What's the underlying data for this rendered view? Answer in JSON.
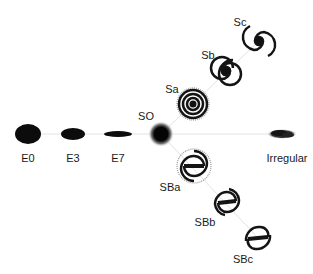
{
  "diagram": {
    "colors": {
      "ink": "#111111",
      "line": "#dcdcdc",
      "background": "#ffffff"
    },
    "nodes": [
      {
        "id": "E0",
        "label": "E0",
        "kind": "elliptical",
        "cx": 28,
        "cy": 134,
        "rx": 13,
        "ry": 10,
        "lx": 28,
        "ly": 158
      },
      {
        "id": "E3",
        "label": "E3",
        "kind": "elliptical",
        "cx": 73,
        "cy": 134,
        "rx": 12,
        "ry": 6,
        "lx": 73,
        "ly": 158
      },
      {
        "id": "E7",
        "label": "E7",
        "kind": "elliptical",
        "cx": 118,
        "cy": 134,
        "rx": 14,
        "ry": 3,
        "lx": 118,
        "ly": 158
      },
      {
        "id": "SO",
        "label": "SO",
        "kind": "lenticular",
        "cx": 161,
        "cy": 134,
        "r": 9,
        "lx": 146,
        "ly": 116
      },
      {
        "id": "Sa",
        "label": "Sa",
        "kind": "spiral",
        "cx": 193,
        "cy": 104,
        "r": 16,
        "lx": 172,
        "ly": 89
      },
      {
        "id": "Sb",
        "label": "Sb",
        "kind": "spiral",
        "cx": 226,
        "cy": 71,
        "r": 15,
        "lx": 208,
        "ly": 55
      },
      {
        "id": "Sc",
        "label": "Sc",
        "kind": "spiral",
        "cx": 259,
        "cy": 41,
        "r": 15,
        "lx": 240,
        "ly": 22
      },
      {
        "id": "SBa",
        "label": "SBa",
        "kind": "barred-spiral",
        "cx": 194,
        "cy": 166,
        "r": 17,
        "lx": 170,
        "ly": 187
      },
      {
        "id": "SBb",
        "label": "SBb",
        "kind": "barred-spiral",
        "cx": 227,
        "cy": 202,
        "r": 16,
        "lx": 205,
        "ly": 222
      },
      {
        "id": "SBc",
        "label": "SBc",
        "kind": "barred-spiral",
        "cx": 258,
        "cy": 238,
        "r": 16,
        "lx": 243,
        "ly": 259
      },
      {
        "id": "Irregular",
        "label": "Irregular",
        "kind": "irregular",
        "cx": 282,
        "cy": 134,
        "lx": 287,
        "ly": 158
      }
    ]
  }
}
